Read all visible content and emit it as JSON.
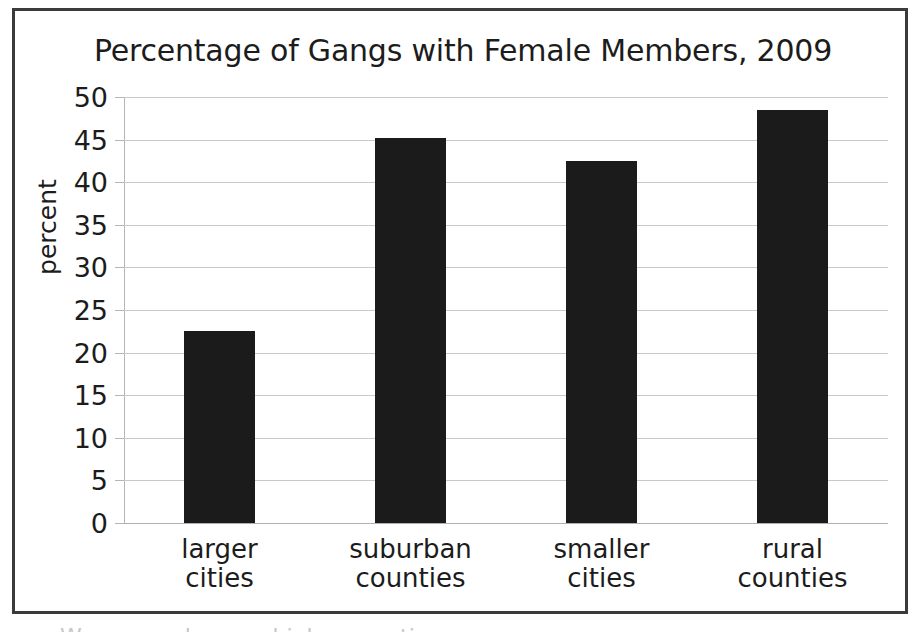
{
  "figure": {
    "frame_color": "#3b3b3b",
    "background": "#ffffff",
    "bottom_clipped_caption": "Women make up a high proportion"
  },
  "chart_data": {
    "type": "bar",
    "title": "Percentage of Gangs with Female Members, 2009",
    "xlabel": "",
    "ylabel": "percent",
    "categories": [
      "larger\ncities",
      "suburban\ncounties",
      "smaller\ncities",
      "rural\ncounties"
    ],
    "categories_flat": [
      "larger cities",
      "suburban counties",
      "smaller cities",
      "rural counties"
    ],
    "values": [
      22.5,
      45.2,
      42.5,
      48.5
    ],
    "ylim": [
      0,
      50
    ],
    "yticks": [
      0,
      5,
      10,
      15,
      20,
      25,
      30,
      35,
      40,
      45,
      50
    ],
    "ytick_labels": [
      "0",
      "5",
      "10",
      "15",
      "20",
      "25",
      "30",
      "35",
      "40",
      "45",
      "50"
    ],
    "grid": true,
    "legend": false,
    "bar_color": "#1b1b1b",
    "gridline_color": "#c9c9c9"
  }
}
